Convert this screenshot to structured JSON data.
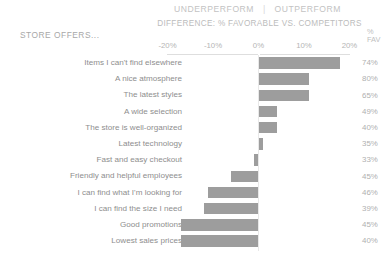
{
  "header": {
    "underperform": "UNDERPERFORM",
    "separator": "|",
    "outperform": "OUTPERFORM",
    "difference_title": "DIFFERENCE: % FAVORABLE VS. COMPETITORS",
    "category_label": "STORE OFFERS...",
    "value_col_line1": "%",
    "value_col_line2": "FAV"
  },
  "axis": {
    "ticks": [
      "-20%",
      "-10%",
      "0%",
      "10%",
      "20%"
    ],
    "tick_values": [
      -20,
      -10,
      0,
      10,
      20
    ]
  },
  "colors": {
    "bar": "#9d9d9d",
    "axis": "#dedede",
    "label": "#8e8e8e",
    "muted": "#b5b5b5"
  },
  "chart_data": {
    "type": "bar",
    "title": "DIFFERENCE: % FAVORABLE VS. COMPETITORS",
    "subtitle": "UNDERPERFORM  |  OUTPERFORM",
    "xlabel": "Difference: % favorable vs. competitors",
    "ylabel": "STORE OFFERS...",
    "xlim": [
      -22,
      22
    ],
    "grid": false,
    "orientation": "horizontal",
    "categories": [
      "Items I can't find elsewhere",
      "A nice atmosphere",
      "The latest styles",
      "A wide selection",
      "The store is well-organized",
      "Latest technology",
      "Fast and easy checkout",
      "Friendly and helpful employees",
      "I can find what I'm looking for",
      "I can find the size I need",
      "Good promotions",
      "Lowest sales prices"
    ],
    "series": [
      {
        "name": "Difference: % favorable vs. competitors",
        "values": [
          18,
          11,
          11,
          4,
          4,
          1,
          -1,
          -6,
          -11,
          -12,
          -17,
          -17
        ]
      },
      {
        "name": "% FAV",
        "values": [
          74,
          80,
          65,
          49,
          40,
          35,
          33,
          45,
          46,
          39,
          45,
          40
        ],
        "display": [
          "74%",
          "80%",
          "65%",
          "49%",
          "40%",
          "35%",
          "33%",
          "45%",
          "46%",
          "39%",
          "45%",
          "40%"
        ]
      }
    ]
  }
}
